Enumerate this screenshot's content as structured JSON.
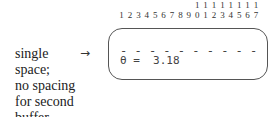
{
  "column_numbers": {
    "tens": [
      "",
      "",
      "",
      "",
      "",
      "",
      "",
      "",
      "",
      "1",
      "1",
      "1",
      "1",
      "1",
      "1",
      "1",
      "1"
    ],
    "ones": [
      "1",
      "2",
      "3",
      "4",
      "5",
      "6",
      "7",
      "8",
      "9",
      "0",
      "1",
      "2",
      "3",
      "4",
      "5",
      "6",
      "7"
    ]
  },
  "annotation": {
    "lines": [
      "single",
      "space;",
      "no spacing",
      "for second",
      "buffer"
    ],
    "arrow": "→"
  },
  "display": {
    "dashes": "- - - - - - - - - -",
    "value_line": "θ =  3.18"
  }
}
